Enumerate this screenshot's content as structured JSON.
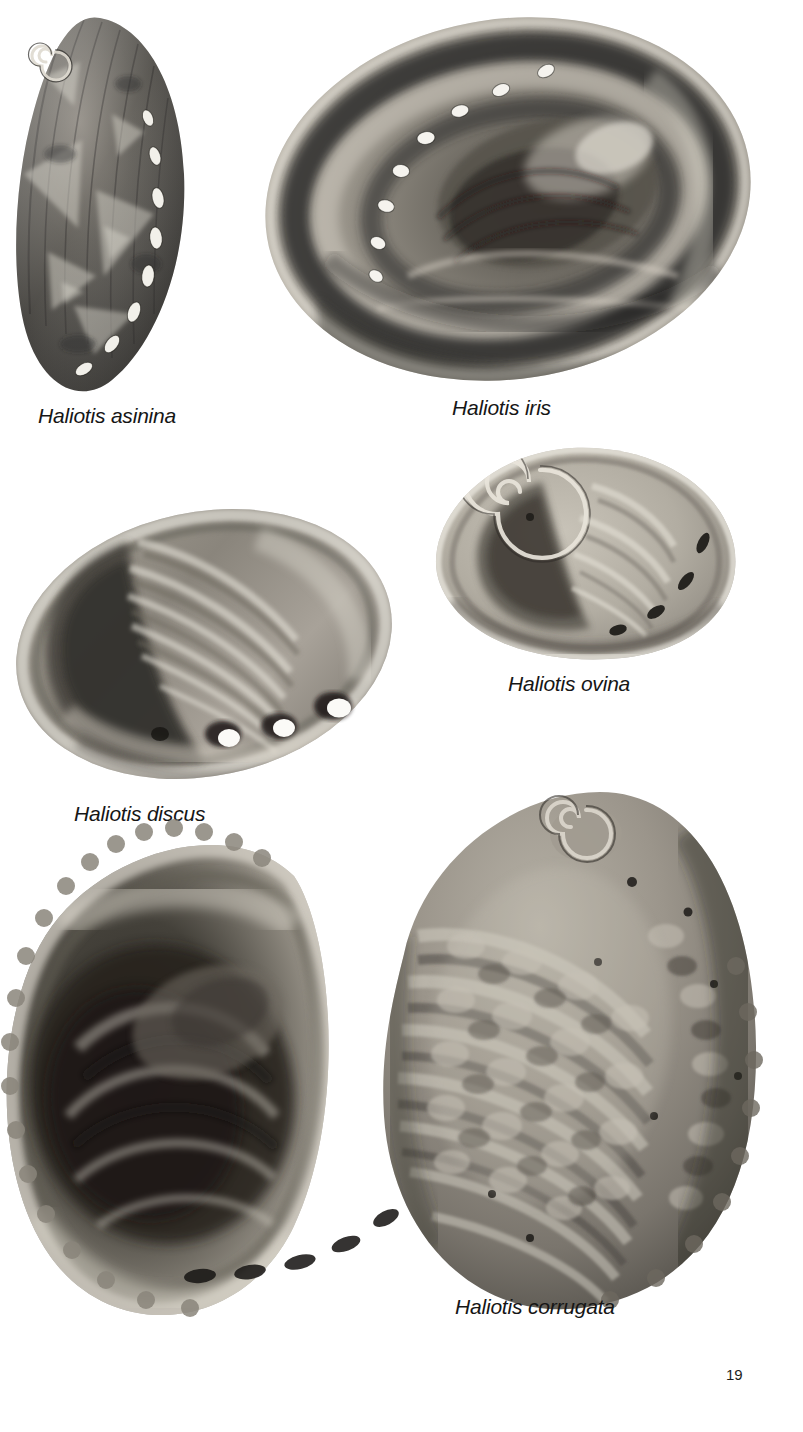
{
  "page": {
    "folio": "19",
    "background_color": "#ffffff",
    "text_color": "#161616",
    "kind": "book-plate"
  },
  "figures": [
    {
      "id": "asinina",
      "caption": "Haliotis asinina",
      "view": "dorsal exterior",
      "description": "narrow elongate dark shell, spiral apex upper-left, curved row of white oval respiratory pores down the right margin",
      "pore_count": 8,
      "pore_color": "#f2f0ea",
      "shell_tone": "#4a4843"
    },
    {
      "id": "iris",
      "caption": "Haliotis iris",
      "view": "interior nacre",
      "description": "large broad oval shell, dark banded nacre interior, arcing row of white pores along the upper-left rim",
      "pore_count": 8,
      "pore_color": "#f5f3ee",
      "shell_tone": "#6e6a63"
    },
    {
      "id": "ovina",
      "caption": "Haliotis ovina",
      "view": "interior",
      "description": "small rounded pale shell, prominent spiral at upper-left, four dark open pores on the lower-right margin",
      "pore_count": 4,
      "pore_color": "#262420",
      "shell_tone": "#b9b4aa"
    },
    {
      "id": "discus",
      "caption": "Haliotis discus",
      "view": "interior",
      "description": "oval ribbed shell, radial ridges, three bright white raised pores along the lower-right edge",
      "pore_count": 3,
      "pore_color": "#fbfaf7",
      "shell_tone": "#8d8880"
    },
    {
      "id": "corrugata",
      "caption": "Haliotis corrugata",
      "view": "paired: interior left, corrugated exterior right",
      "description": "two large shells, the left showing the dark concave interior with scalloped rim, the right showing the knobbed corrugated exterior with spiral apex at top",
      "pore_count": 5,
      "pore_color": "#1a1816",
      "shell_tone": "#9a948a"
    }
  ]
}
